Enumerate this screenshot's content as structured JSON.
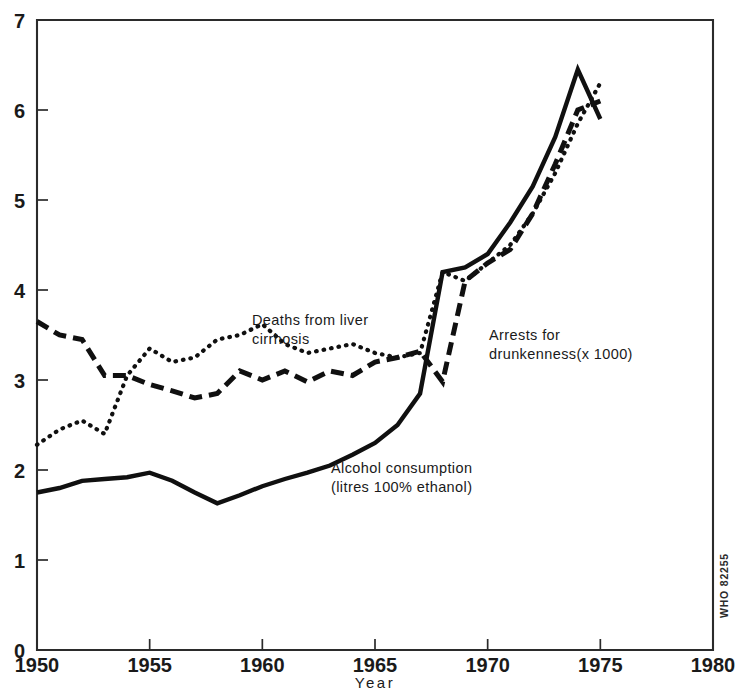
{
  "chart_data": {
    "type": "line",
    "title": "",
    "xlabel": "Year",
    "ylabel": "",
    "xlim": [
      1950,
      1980
    ],
    "ylim": [
      0,
      7
    ],
    "grid": false,
    "legend_position": "inline-annotations",
    "x_ticks": [
      "1950",
      "1955",
      "1960",
      "1965",
      "1970",
      "1975",
      "1980"
    ],
    "y_ticks": [
      "0",
      "1",
      "2",
      "3",
      "4",
      "5",
      "6",
      "7"
    ],
    "credit": "WHO 82255",
    "series": [
      {
        "name": "Alcohol consumption (litres 100% ethanol)",
        "style": "solid",
        "annotation_line1": "Alcohol consumption",
        "annotation_line2": "(litres 100% ethanol)",
        "x": [
          1950,
          1951,
          1952,
          1953,
          1954,
          1955,
          1956,
          1957,
          1958,
          1959,
          1960,
          1961,
          1962,
          1963,
          1964,
          1965,
          1966,
          1967,
          1968,
          1969,
          1970,
          1971,
          1972,
          1973,
          1974,
          1975
        ],
        "values": [
          1.75,
          1.8,
          1.88,
          1.9,
          1.92,
          1.97,
          1.88,
          1.75,
          1.63,
          1.72,
          1.82,
          1.9,
          1.97,
          2.05,
          2.17,
          2.3,
          2.5,
          2.85,
          4.2,
          4.25,
          4.4,
          4.75,
          5.15,
          5.7,
          6.45,
          5.9
        ]
      },
      {
        "name": "Arrests for drunkenness (x 1000)",
        "style": "dashed",
        "annotation_line1": "Arrests for",
        "annotation_line2": "drunkenness(x 1000)",
        "x": [
          1950,
          1951,
          1952,
          1953,
          1954,
          1955,
          1956,
          1957,
          1958,
          1959,
          1960,
          1961,
          1962,
          1963,
          1964,
          1965,
          1966,
          1967,
          1968,
          1969,
          1970,
          1971,
          1972,
          1973,
          1974,
          1975
        ],
        "values": [
          3.65,
          3.5,
          3.45,
          3.05,
          3.05,
          2.95,
          2.88,
          2.8,
          2.85,
          3.1,
          3.0,
          3.1,
          2.98,
          3.1,
          3.05,
          3.2,
          3.25,
          3.32,
          2.98,
          4.1,
          4.3,
          4.45,
          4.85,
          5.4,
          6.0,
          6.1
        ]
      },
      {
        "name": "Deaths from liver cirrhosis",
        "style": "dotted",
        "annotation_line1": "Deaths from liver",
        "annotation_line2": "cirrhosis",
        "x": [
          1950,
          1951,
          1952,
          1953,
          1954,
          1955,
          1956,
          1957,
          1958,
          1959,
          1960,
          1961,
          1962,
          1963,
          1964,
          1965,
          1966,
          1967,
          1968,
          1969,
          1970,
          1971,
          1972,
          1973,
          1974,
          1975
        ],
        "values": [
          2.28,
          2.45,
          2.55,
          2.4,
          3.05,
          3.35,
          3.2,
          3.25,
          3.45,
          3.5,
          3.62,
          3.4,
          3.3,
          3.35,
          3.4,
          3.3,
          3.25,
          3.3,
          4.2,
          4.1,
          4.3,
          4.5,
          4.85,
          5.3,
          5.85,
          6.3
        ]
      }
    ]
  },
  "credit_label": "WHO 82255",
  "axis": {
    "x_title": "Year"
  }
}
